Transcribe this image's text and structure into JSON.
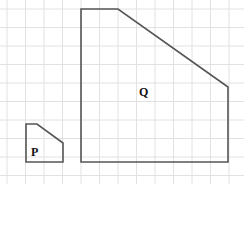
{
  "grid": {
    "origin_x": 7,
    "origin_y": 9,
    "spacing": 18.5,
    "cols": 13,
    "rows": 9,
    "color": "#e2e2e2"
  },
  "shapes": {
    "P": {
      "label": "P",
      "points": "26,124 37,124 63,143 63,162 26,162"
    },
    "Q": {
      "label": "Q",
      "points": "81,9 118,9 228,87 228,162 81,162"
    }
  },
  "stroke_color": "#555555"
}
